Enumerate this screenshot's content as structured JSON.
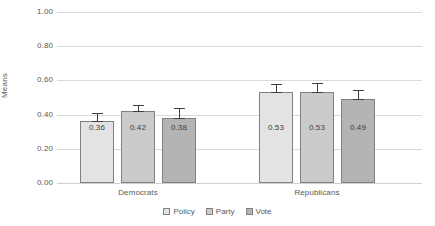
{
  "chart_data": {
    "type": "bar",
    "title": "",
    "xlabel": "",
    "ylabel": "Means",
    "ylim": [
      0,
      1.0
    ],
    "ytick_labels": [
      "1.00",
      "0.80",
      "0.60",
      "0.40",
      "0.20",
      "0.00"
    ],
    "ytick_values": [
      1.0,
      0.8,
      0.6,
      0.4,
      0.2,
      0.0
    ],
    "grid": true,
    "legend_position": "bottom",
    "categories": [
      "Democrats",
      "Republicans"
    ],
    "series": [
      {
        "name": "Policy",
        "color": "#e3e3e3",
        "values": [
          0.36,
          0.53
        ],
        "labels": [
          "0.36",
          "0.53"
        ],
        "errors": [
          0.05,
          0.05
        ]
      },
      {
        "name": "Party",
        "color": "#cbcbcb",
        "values": [
          0.42,
          0.53
        ],
        "labels": [
          "0.42",
          "0.53"
        ],
        "errors": [
          0.035,
          0.057
        ]
      },
      {
        "name": "Vote",
        "color": "#b4b4b4",
        "values": [
          0.38,
          0.49
        ],
        "labels": [
          "0.38",
          "0.49"
        ],
        "errors": [
          0.06,
          0.055
        ]
      }
    ]
  }
}
